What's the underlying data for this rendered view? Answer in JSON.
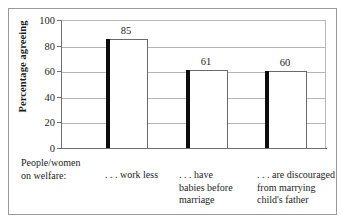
{
  "chart_data": {
    "type": "bar",
    "title": "",
    "xlabel": "",
    "ylabel": "Percentage agreeing",
    "ylim": [
      0,
      100
    ],
    "yticks": [
      0,
      20,
      40,
      60,
      80,
      100
    ],
    "grid": true,
    "legend": "none",
    "stem_label": "People/women\non welfare:",
    "categories": [
      ". . . work less",
      ". . . have\nbabies before\nmarriage",
      ". . . are discouraged\nfrom marrying\nchild's father"
    ],
    "values": [
      85,
      61,
      60
    ],
    "value_labels": [
      "85",
      "61",
      "60"
    ],
    "bar_color": "#0c0c0c",
    "bar_fill": "#ffffff",
    "bar_outline": "#6a6a6a",
    "grid_color": "#b5b5b5",
    "axis_color": "#6f6f6f",
    "frame_color": "#9a9a9a",
    "text_color": "#1d1d1d"
  }
}
